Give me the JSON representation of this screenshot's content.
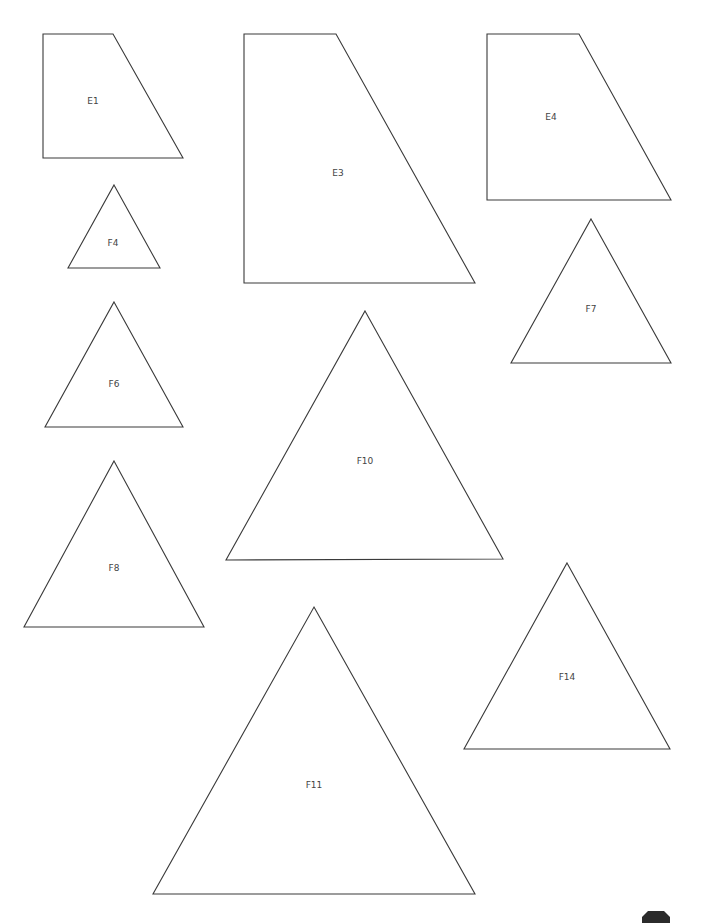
{
  "page": {
    "background": "#ffffff",
    "stroke_color": "#3a3a3a",
    "label_color": "#444444"
  },
  "shapes": [
    {
      "id": "E1",
      "type": "trapezoid",
      "points": "43,34 113,34 183,158 43,158",
      "label": "E1",
      "label_x": 93,
      "label_y": 101
    },
    {
      "id": "E3",
      "type": "trapezoid",
      "points": "244,34 336,34 475,283 244,283",
      "label": "E3",
      "label_x": 338,
      "label_y": 173
    },
    {
      "id": "E4",
      "type": "trapezoid",
      "points": "487,34 579,34 671,200 487,200",
      "label": "E4",
      "label_x": 551,
      "label_y": 117
    },
    {
      "id": "F4",
      "type": "triangle",
      "points": "114,185 160,268 68,268",
      "label": "F4",
      "label_x": 113,
      "label_y": 243
    },
    {
      "id": "F6",
      "type": "triangle",
      "points": "114,302 183,427 45,427",
      "label": "F6",
      "label_x": 114,
      "label_y": 384
    },
    {
      "id": "F7",
      "type": "triangle",
      "points": "591,219 671,363 511,363",
      "label": "F7",
      "label_x": 591,
      "label_y": 309
    },
    {
      "id": "F8",
      "type": "triangle",
      "points": "114,461 204,627 24,627",
      "label": "F8",
      "label_x": 114,
      "label_y": 568
    },
    {
      "id": "F10",
      "type": "triangle",
      "points": "365,311 503,559 226,560",
      "label": "F10",
      "label_x": 365,
      "label_y": 461
    },
    {
      "id": "F11",
      "type": "triangle",
      "points": "314,607 475,894 153,894",
      "label": "F11",
      "label_x": 314,
      "label_y": 785
    },
    {
      "id": "F14",
      "type": "triangle",
      "points": "567,563 670,749 464,749",
      "label": "F14",
      "label_x": 567,
      "label_y": 677
    }
  ],
  "corner_badge": {
    "icon": "octagon-badge-icon",
    "color": "#2b2b2b",
    "points": "648,911 664,911 670,917 670,923 642,923 642,917"
  }
}
